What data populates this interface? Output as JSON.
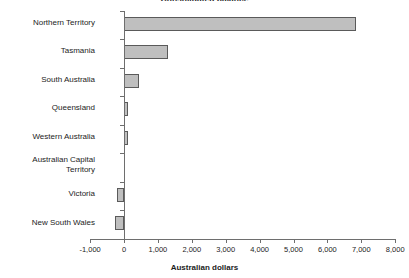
{
  "chart_data": {
    "type": "bar",
    "orientation": "horizontal",
    "title": "Consolidated balance",
    "xlabel": "Australian dollars",
    "ylabel": "",
    "categories": [
      "Northern Territory",
      "Tasmania",
      "South Australia",
      "Queensland",
      "Western Australia",
      "Australian Capital\nTerritory",
      "Victoria",
      "New South Wales"
    ],
    "values": [
      6850,
      1310,
      440,
      130,
      115,
      0,
      -200,
      -260
    ],
    "xlim": [
      -1000,
      8000
    ],
    "xticks": [
      -1000,
      0,
      1000,
      2000,
      3000,
      4000,
      5000,
      6000,
      7000,
      8000
    ],
    "xtick_labels": [
      "-1,000",
      "0",
      "1,000",
      "2,000",
      "3,000",
      "4,000",
      "5,000",
      "6,000",
      "7,000",
      "8,000"
    ],
    "grid": false,
    "legend": false,
    "bar_fill_color": "#bfbfbf",
    "bar_edge_color": "#5a5a5a",
    "axis_color": "#6e6e6e"
  }
}
